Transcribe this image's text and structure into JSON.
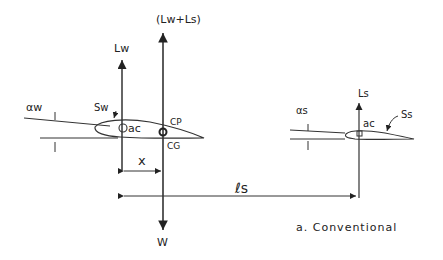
{
  "diagram": {
    "type": "aircraft-longitudinal-force-diagram",
    "caption": "a.  Conventional",
    "labels": {
      "total_lift": "(Lw+Ls)",
      "wing_lift": "Lw",
      "stab_lift": "Ls",
      "weight": "W",
      "wing_alpha": "αw",
      "stab_alpha": "αs",
      "wing_area": "Sw",
      "stab_area": "Ss",
      "wing_ac": "ac",
      "stab_ac": "ac",
      "cp": "CP",
      "cg": "CG",
      "x_dim": "x",
      "ls_dim": "ℓs"
    },
    "colors": {
      "ink": "#333333",
      "background": "#ffffff"
    }
  }
}
